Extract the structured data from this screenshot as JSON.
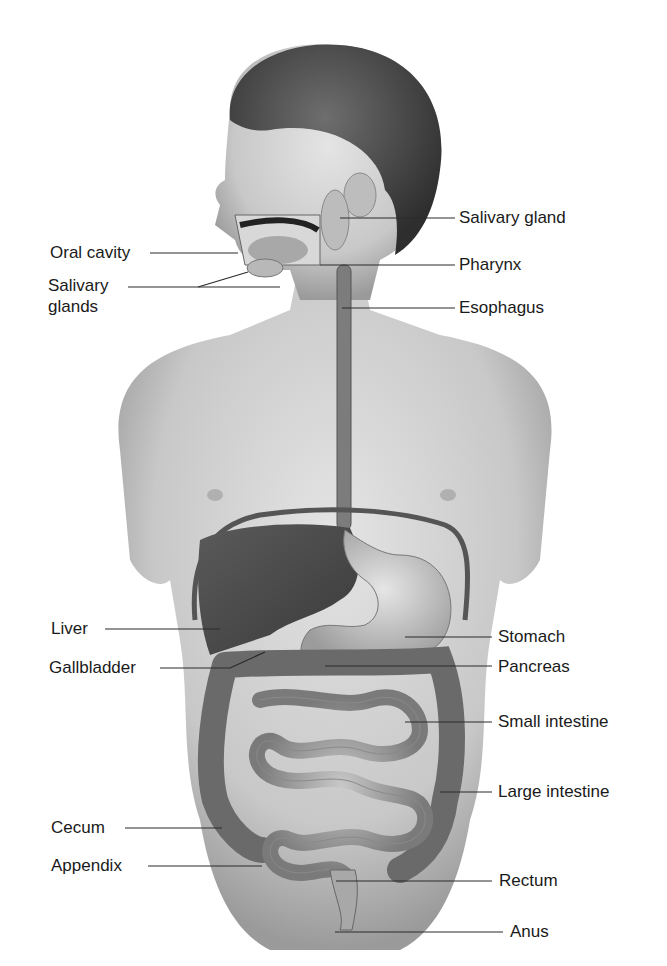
{
  "diagram": {
    "labels_left": [
      {
        "id": "oral-cavity",
        "text": "Oral cavity"
      },
      {
        "id": "salivary-glands",
        "text_line1": "Salivary",
        "text_line2": "glands"
      },
      {
        "id": "liver",
        "text": "Liver"
      },
      {
        "id": "gallbladder",
        "text": "Gallbladder"
      },
      {
        "id": "cecum",
        "text": "Cecum"
      },
      {
        "id": "appendix",
        "text": "Appendix"
      }
    ],
    "labels_right": [
      {
        "id": "salivary-gland",
        "text": "Salivary gland"
      },
      {
        "id": "pharynx",
        "text": "Pharynx"
      },
      {
        "id": "esophagus",
        "text": "Esophagus"
      },
      {
        "id": "stomach",
        "text": "Stomach"
      },
      {
        "id": "pancreas",
        "text": "Pancreas"
      },
      {
        "id": "small-intestine",
        "text": "Small intestine"
      },
      {
        "id": "large-intestine",
        "text": "Large intestine"
      },
      {
        "id": "rectum",
        "text": "Rectum"
      },
      {
        "id": "anus",
        "text": "Anus"
      }
    ]
  }
}
